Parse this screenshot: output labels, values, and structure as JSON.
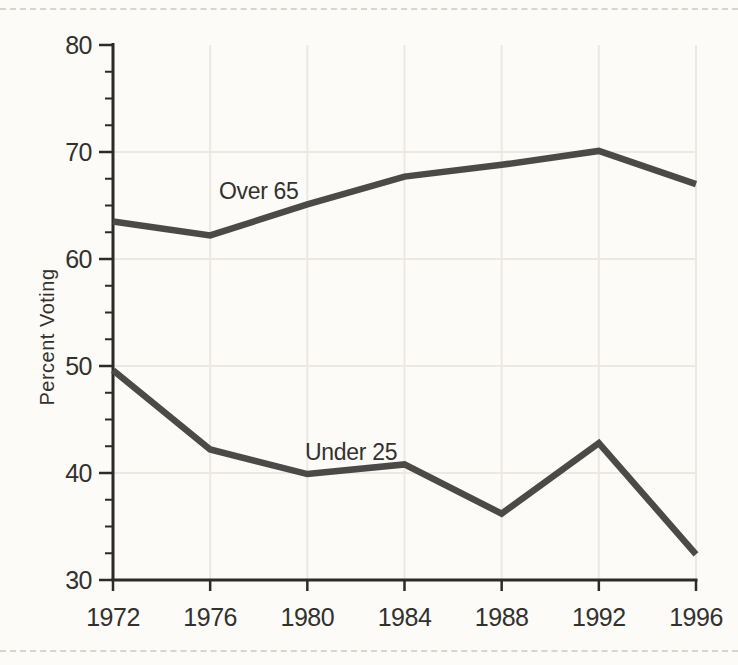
{
  "page": {
    "background": "#fcfbf8",
    "edge_rule_color": "#ccc9c4"
  },
  "chart_data": {
    "type": "line",
    "title": "",
    "xlabel": "",
    "ylabel": "Percent Voting",
    "x": [
      1972,
      1976,
      1980,
      1984,
      1988,
      1992,
      1996
    ],
    "x_tick_labels": [
      "1972",
      "1976",
      "1980",
      "1984",
      "1988",
      "1992",
      "1996"
    ],
    "xlim": [
      1972,
      1996
    ],
    "ylim": [
      30,
      80
    ],
    "y_ticks": [
      30,
      40,
      50,
      60,
      70,
      80
    ],
    "y_minor_step": 2.5,
    "grid_y": [
      40,
      50,
      60,
      70
    ],
    "grid": true,
    "legend": "inline-labels",
    "series": [
      {
        "name": "Over 65",
        "values": [
          63.5,
          62.2,
          65.1,
          67.7,
          68.8,
          70.1,
          67.0
        ],
        "label_pos": {
          "x": 1978.0,
          "y": 65.6
        }
      },
      {
        "name": "Under 25",
        "values": [
          49.6,
          42.2,
          39.9,
          40.8,
          36.2,
          42.8,
          32.4
        ],
        "label_pos": {
          "x": 1981.8,
          "y": 41.2
        }
      }
    ],
    "colors": {
      "line": "#4b4a48",
      "axis": "#2d2b29",
      "grid": "#ece8e3",
      "label": "#33312e"
    }
  }
}
